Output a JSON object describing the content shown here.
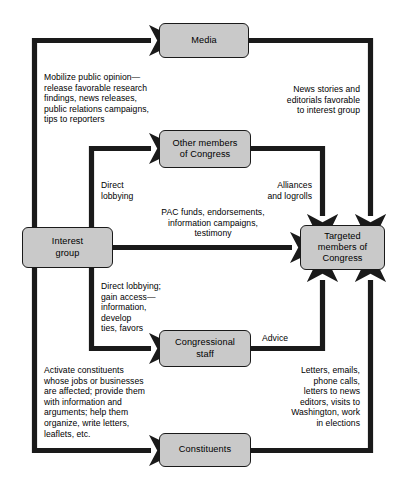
{
  "diagram": {
    "background_color": "#ffffff",
    "node_fill": "#c9c9c9",
    "line_color": "#1a1a1a",
    "nodes": [
      {
        "id": "media",
        "label": "Media",
        "x": 159,
        "y": 23,
        "w": 90,
        "h": 35
      },
      {
        "id": "other-members",
        "label": "Other members\nof Congress",
        "x": 159,
        "y": 130,
        "w": 92,
        "h": 38
      },
      {
        "id": "interest-group",
        "label": "Interest\ngroup",
        "x": 22,
        "y": 227,
        "w": 91,
        "h": 41
      },
      {
        "id": "targeted-members",
        "label": "Targeted\nmembers of\nCongress",
        "x": 300,
        "y": 225,
        "w": 85,
        "h": 45
      },
      {
        "id": "congressional-staff",
        "label": "Congressional\nstaff",
        "x": 159,
        "y": 330,
        "w": 92,
        "h": 37
      },
      {
        "id": "constituents",
        "label": "Constituents",
        "x": 159,
        "y": 433,
        "w": 92,
        "h": 34
      }
    ],
    "captions": [
      {
        "id": "mobilize-public-opinion",
        "text": "Mobilize public opinion—\nrelease favorable research\nfindings, news releases,\npublic relations campaigns,\ntips to reporters",
        "align": "left",
        "x": 44,
        "y": 72,
        "w": 150
      },
      {
        "id": "news-stories",
        "text": "News stories and\neditorials favorable\nto interest group",
        "align": "right",
        "x": 232,
        "y": 84,
        "w": 128
      },
      {
        "id": "direct-lobbying",
        "text": "Direct\nlobbying",
        "align": "left",
        "x": 101,
        "y": 180,
        "w": 70
      },
      {
        "id": "alliances-and-logrolls",
        "text": "Alliances\nand logrolls",
        "align": "right",
        "x": 242,
        "y": 180,
        "w": 70
      },
      {
        "id": "pac-funds",
        "text": "PAC funds, endorsements,\ninformation campaigns,\ntestimony",
        "align": "center",
        "x": 133,
        "y": 207,
        "w": 160
      },
      {
        "id": "direct-lobbying-access",
        "text": "Direct lobbying;\ngain access—\ninformation,\ndevelop\nties, favors",
        "align": "left",
        "x": 101,
        "y": 281,
        "w": 92
      },
      {
        "id": "advice",
        "text": "Advice",
        "align": "left",
        "x": 262,
        "y": 333,
        "w": 50
      },
      {
        "id": "activate-constituents",
        "text": "Activate constituents\nwhose jobs or businesses\nare affected; provide them\nwith information and\narguments; help them\norganize, write letters,\nleaflets, etc.",
        "align": "left",
        "x": 44,
        "y": 365,
        "w": 155
      },
      {
        "id": "letters-emails",
        "text": "Letters, emails,\nphone calls,\nletters to news\neditors, visits to\nWashington, work\nin elections",
        "align": "right",
        "x": 240,
        "y": 365,
        "w": 120
      }
    ],
    "flows": [
      {
        "id": "interest-group-to-media",
        "from": "interest-group",
        "to": "media",
        "caption": "mobilize-public-opinion"
      },
      {
        "id": "media-to-targeted-members",
        "from": "media",
        "to": "targeted-members",
        "caption": "news-stories"
      },
      {
        "id": "interest-group-to-other-members",
        "from": "interest-group",
        "to": "other-members",
        "caption": "direct-lobbying"
      },
      {
        "id": "other-members-to-targeted-members",
        "from": "other-members",
        "to": "targeted-members",
        "caption": "alliances-and-logrolls"
      },
      {
        "id": "interest-group-to-targeted-members",
        "from": "interest-group",
        "to": "targeted-members",
        "caption": "pac-funds"
      },
      {
        "id": "interest-group-to-congressional-staff",
        "from": "interest-group",
        "to": "congressional-staff",
        "caption": "direct-lobbying-access"
      },
      {
        "id": "congressional-staff-to-targeted-members",
        "from": "congressional-staff",
        "to": "targeted-members",
        "caption": "advice"
      },
      {
        "id": "interest-group-to-constituents",
        "from": "interest-group",
        "to": "constituents",
        "caption": "activate-constituents"
      },
      {
        "id": "constituents-to-targeted-members",
        "from": "constituents",
        "to": "targeted-members",
        "caption": "letters-emails"
      }
    ]
  }
}
